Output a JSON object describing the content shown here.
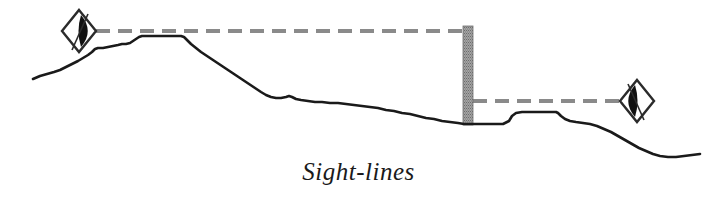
{
  "figure": {
    "caption": "Sight-lines",
    "title": "Sight-lines",
    "width": 717,
    "height": 207,
    "background_color": "#ffffff"
  },
  "colors": {
    "terrain_stroke": "#1a1a1a",
    "sightline_dash": "#8a8a8a",
    "wall_fill": "#9a9a9a",
    "wall_edge": "#6f6f6f",
    "eye_outline": "#2b2b2b",
    "eye_pupil": "#111111",
    "caption_text": "#1a1a1a"
  },
  "diagram": {
    "type": "terrain-cross-section",
    "terrain_profile": {
      "name": "ground-profile",
      "description": "Continuous hand-drawn ground surface running from lower-left up over a plateau, down a long slope to a low basin at the wall, then across a stepped terrace and down to the lower-right",
      "points": "33,79 40,76 47,74 54,72 60,70 66,67 72,64 78,61 83,58 88,55 92,52 95,49 98,48 103,48 108,47 113,46 118,45 122,44 126,44 130,43 133,41 136,39 139,37 142,36 146,36 152,36 158,36 164,36 170,36 176,36 181,36 184,37 187,40 191,44 196,48 201,52 207,56 213,60 219,64 225,68 231,72 237,76 243,80 249,84 255,88 261,92 266,95 271,97 276,98 281,98 286,97 289,96 292,97 296,99 301,100 308,101 315,102 322,102 330,103 338,103 346,104 354,105 362,106 370,107 378,108 386,110 394,111 402,113 410,114 418,116 426,118 434,119 442,121 450,122 458,123 464,124 472,124 480,124 488,124 496,124 503,124 509,121 512,116 516,113 522,112 530,112 538,112 546,112 552,112 556,112 558,113 561,116 565,119 570,121 576,122 583,123 590,124 597,126 604,129 611,132 618,136 625,140 632,144 639,148 646,151 653,154 660,156 668,157 676,157 684,156 692,155 700,154"
    },
    "wall": {
      "name": "vertical-wall",
      "x": 463,
      "y": 26,
      "width": 10,
      "height": 99,
      "hatch_pattern": "vertical-stipple"
    },
    "sightlines": [
      {
        "name": "upper-sightline",
        "from_x": 96,
        "from_y": 31,
        "to_x": 463,
        "to_y": 31,
        "dash": "14 8"
      },
      {
        "name": "lower-sightline",
        "from_x": 473,
        "from_y": 101,
        "to_x": 627,
        "to_y": 101,
        "dash": "14 8"
      }
    ],
    "viewpoints": [
      {
        "name": "left-eye-marker",
        "label": "observer-left",
        "cx": 79,
        "cy": 31,
        "half_w": 17,
        "half_h": 21,
        "pupil_side": "right",
        "tick_from_x": 88,
        "tick_from_y": 14,
        "tick_to_x": 72,
        "tick_to_y": 50
      },
      {
        "name": "right-eye-marker",
        "label": "observer-right",
        "cx": 637,
        "cy": 101,
        "half_w": 17,
        "half_h": 21,
        "pupil_side": "left",
        "tick_from_x": 628,
        "tick_from_y": 84,
        "tick_to_x": 644,
        "tick_to_y": 120
      }
    ]
  }
}
